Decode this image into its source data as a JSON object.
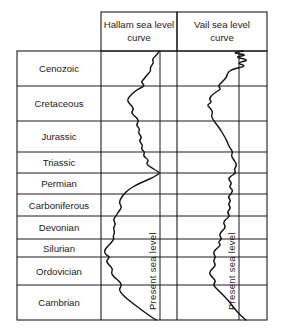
{
  "figure": {
    "present_sea_level_label": "Present sea level"
  },
  "headers": [
    {
      "name": "hallam",
      "line1": "Hallam sea level",
      "line2": "curve"
    },
    {
      "name": "vail",
      "line1": "Vail sea level",
      "line2": "curve"
    }
  ],
  "eras": [
    {
      "label": "Cenozoic",
      "top": 51,
      "bottom": 86
    },
    {
      "label": "Cretaceous",
      "top": 86,
      "bottom": 121
    },
    {
      "label": "Jurassic",
      "top": 121,
      "bottom": 152
    },
    {
      "label": "Triassic",
      "top": 152,
      "bottom": 173
    },
    {
      "label": "Permian",
      "top": 173,
      "bottom": 194
    },
    {
      "label": "Carboniferous",
      "top": 194,
      "bottom": 216
    },
    {
      "label": "Devonian",
      "top": 216,
      "bottom": 239
    },
    {
      "label": "Silurian",
      "top": 239,
      "bottom": 257
    },
    {
      "label": "Ordovician",
      "top": 257,
      "bottom": 285
    },
    {
      "label": "Cambrian",
      "top": 285,
      "bottom": 320
    }
  ],
  "chart_data": {
    "type": "line",
    "xlabel": "Relative sea level",
    "ylabel": "Geologic period",
    "grid": true,
    "legend": "none",
    "orientation": "vertical-time-axis",
    "time_axis_note": "Youngest (Cenozoic) at top, oldest (Cambrian) at bottom",
    "categories": [
      "Cenozoic",
      "Cretaceous",
      "Jurassic",
      "Triassic",
      "Permian",
      "Carboniferous",
      "Devonian",
      "Silurian",
      "Ordovician",
      "Cambrian"
    ],
    "reference_lines": [
      {
        "name": "hallam-present-sea-level",
        "x": 160,
        "label": "Present sea level"
      },
      {
        "name": "vail-present-sea-level",
        "x": 239,
        "label": "Present sea level"
      }
    ],
    "panels": [
      {
        "name": "hallam",
        "x_range": [
          101,
          175
        ],
        "present_sea_level_x": 160,
        "points": [
          [
            159,
            51
          ],
          [
            157,
            55
          ],
          [
            152,
            59
          ],
          [
            154,
            63
          ],
          [
            150,
            67
          ],
          [
            151,
            71
          ],
          [
            147,
            75
          ],
          [
            144,
            79
          ],
          [
            141,
            82
          ],
          [
            145,
            86
          ],
          [
            138,
            89
          ],
          [
            133,
            93
          ],
          [
            129,
            97
          ],
          [
            127,
            101
          ],
          [
            131,
            105
          ],
          [
            134,
            109
          ],
          [
            131,
            113
          ],
          [
            136,
            117
          ],
          [
            139,
            121
          ],
          [
            136,
            125
          ],
          [
            140,
            129
          ],
          [
            138,
            133
          ],
          [
            142,
            137
          ],
          [
            139,
            141
          ],
          [
            143,
            145
          ],
          [
            141,
            149
          ],
          [
            145,
            152
          ],
          [
            143,
            156
          ],
          [
            149,
            160
          ],
          [
            146,
            164
          ],
          [
            152,
            168
          ],
          [
            157,
            171
          ],
          [
            160,
            173
          ],
          [
            154,
            177
          ],
          [
            145,
            181
          ],
          [
            136,
            185
          ],
          [
            128,
            190
          ],
          [
            124,
            194
          ],
          [
            121,
            198
          ],
          [
            119,
            203
          ],
          [
            122,
            207
          ],
          [
            119,
            211
          ],
          [
            116,
            216
          ],
          [
            113,
            220
          ],
          [
            116,
            224
          ],
          [
            113,
            228
          ],
          [
            115,
            232
          ],
          [
            113,
            236
          ],
          [
            114,
            239
          ],
          [
            111,
            243
          ],
          [
            107,
            247
          ],
          [
            104,
            251
          ],
          [
            106,
            255
          ],
          [
            110,
            257
          ],
          [
            106,
            261
          ],
          [
            109,
            265
          ],
          [
            113,
            269
          ],
          [
            111,
            273
          ],
          [
            114,
            277
          ],
          [
            119,
            281
          ],
          [
            122,
            285
          ],
          [
            119,
            289
          ],
          [
            121,
            293
          ],
          [
            125,
            297
          ],
          [
            131,
            302
          ],
          [
            139,
            308
          ],
          [
            147,
            314
          ],
          [
            156,
            320
          ]
        ]
      },
      {
        "name": "vail",
        "x_range": [
          180,
          254
        ],
        "present_sea_level_x": 239,
        "points": [
          [
            243,
            51
          ],
          [
            232,
            53
          ],
          [
            248,
            55
          ],
          [
            234,
            57
          ],
          [
            250,
            60
          ],
          [
            236,
            63
          ],
          [
            247,
            66
          ],
          [
            233,
            69
          ],
          [
            228,
            72
          ],
          [
            227,
            76
          ],
          [
            225,
            79
          ],
          [
            222,
            82
          ],
          [
            218,
            86
          ],
          [
            221,
            89
          ],
          [
            216,
            92
          ],
          [
            212,
            95
          ],
          [
            209,
            99
          ],
          [
            212,
            102
          ],
          [
            207,
            105
          ],
          [
            210,
            108
          ],
          [
            213,
            112
          ],
          [
            211,
            116
          ],
          [
            214,
            121
          ],
          [
            217,
            125
          ],
          [
            220,
            129
          ],
          [
            223,
            134
          ],
          [
            226,
            139
          ],
          [
            228,
            144
          ],
          [
            230,
            148
          ],
          [
            233,
            152
          ],
          [
            231,
            156
          ],
          [
            234,
            160
          ],
          [
            237,
            165
          ],
          [
            234,
            169
          ],
          [
            236,
            173
          ],
          [
            231,
            176
          ],
          [
            228,
            179
          ],
          [
            232,
            183
          ],
          [
            229,
            187
          ],
          [
            233,
            190
          ],
          [
            231,
            194
          ],
          [
            228,
            197
          ],
          [
            231,
            201
          ],
          [
            228,
            204
          ],
          [
            231,
            208
          ],
          [
            227,
            212
          ],
          [
            230,
            216
          ],
          [
            226,
            219
          ],
          [
            223,
            223
          ],
          [
            226,
            227
          ],
          [
            222,
            231
          ],
          [
            219,
            235
          ],
          [
            222,
            239
          ],
          [
            218,
            242
          ],
          [
            221,
            245
          ],
          [
            216,
            249
          ],
          [
            213,
            253
          ],
          [
            216,
            257
          ],
          [
            213,
            261
          ],
          [
            216,
            265
          ],
          [
            212,
            269
          ],
          [
            209,
            273
          ],
          [
            212,
            277
          ],
          [
            216,
            281
          ],
          [
            213,
            285
          ],
          [
            217,
            289
          ],
          [
            222,
            294
          ],
          [
            228,
            300
          ],
          [
            234,
            308
          ],
          [
            240,
            315
          ],
          [
            246,
            320
          ]
        ]
      }
    ]
  }
}
